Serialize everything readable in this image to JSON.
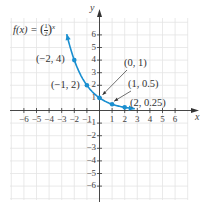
{
  "chart_data": {
    "type": "line",
    "title": "",
    "function_label": "f(x) = (1/2)^x",
    "function_label_parts": {
      "lhs": "f(x) = ",
      "num": "1",
      "den": "2",
      "exp": "x"
    },
    "xlabel": "x",
    "ylabel": "y",
    "xlim": [
      -7,
      7
    ],
    "ylim": [
      -7,
      7
    ],
    "grid": true,
    "x_ticks": [
      -6,
      -5,
      -4,
      -3,
      -2,
      -1,
      1,
      2,
      3,
      4,
      5,
      6
    ],
    "y_ticks": [
      -6,
      -5,
      -4,
      -3,
      -2,
      -1,
      1,
      2,
      3,
      4,
      5,
      6
    ],
    "x_tick_labels": [
      "−6",
      "−5",
      "−4",
      "−3",
      "−2",
      "−1",
      "1",
      "2",
      "3",
      "4",
      "5",
      "6"
    ],
    "y_tick_labels": [
      "−6",
      "−5",
      "−4",
      "−3",
      "−2",
      "−1",
      "1",
      "2",
      "3",
      "4",
      "5",
      "6"
    ],
    "series": [
      {
        "name": "f(x) = (1/2)^x",
        "color": "#1a8fd0",
        "x": [
          -2.6,
          -2,
          -1,
          0,
          1,
          2,
          2.8
        ],
        "y": [
          6.06,
          4,
          2,
          1,
          0.5,
          0.25,
          0.14
        ]
      }
    ],
    "labeled_points": [
      {
        "x": -2,
        "y": 4,
        "label": "(−2, 4)"
      },
      {
        "x": -1,
        "y": 2,
        "label": "(−1, 2)"
      },
      {
        "x": 0,
        "y": 1,
        "label": "(0, 1)"
      },
      {
        "x": 1,
        "y": 0.5,
        "label": "(1, 0.5)"
      },
      {
        "x": 2,
        "y": 0.25,
        "label": "(2, 0.25)"
      }
    ],
    "annotations": [
      "(0, 1)",
      "(1, 0.5)",
      "(2, 0.25)"
    ]
  },
  "colors": {
    "curve": "#1a8fd0",
    "axis": "#333333",
    "grid": "#e4e4e4",
    "text": "#333333"
  }
}
